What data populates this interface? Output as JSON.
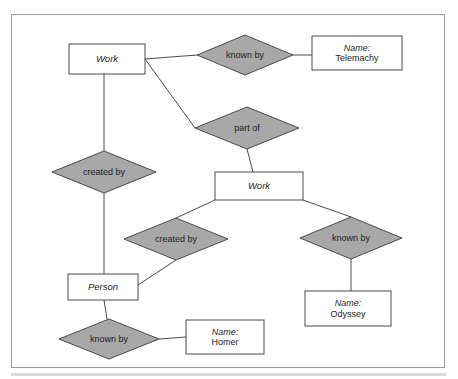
{
  "diagram": {
    "type": "entity-relationship-diagram",
    "title": "",
    "colors": {
      "relationship_fill": "#a8a8a8",
      "entity_fill": "#ffffff",
      "stroke": "#4a4a4a",
      "frame_border": "#9a9a9a",
      "background": "#ffffff",
      "text": "#1c1c1c"
    },
    "nodes": [
      {
        "id": "work-top",
        "kind": "entity",
        "shape": "rectangle",
        "label": "Work",
        "x": 69,
        "y": 44,
        "width": 76,
        "height": 30
      },
      {
        "id": "known-by-top",
        "kind": "relationship",
        "shape": "diamond",
        "label": "known by",
        "cx": 245,
        "cy": 55,
        "rx": 48,
        "ry": 20
      },
      {
        "id": "name-telemachy",
        "kind": "attribute",
        "shape": "rectangle",
        "key": "Name:",
        "value": "Telemachy",
        "x": 312,
        "y": 36,
        "width": 90,
        "height": 34
      },
      {
        "id": "part-of",
        "kind": "relationship",
        "shape": "diamond",
        "label": "part of",
        "cx": 247,
        "cy": 128,
        "rx": 52,
        "ry": 21
      },
      {
        "id": "created-by-left",
        "kind": "relationship",
        "shape": "diamond",
        "label": "created by",
        "cx": 104,
        "cy": 172,
        "rx": 52,
        "ry": 21
      },
      {
        "id": "work-middle",
        "kind": "entity",
        "shape": "rectangle",
        "label": "Work",
        "x": 215,
        "y": 172,
        "width": 88,
        "height": 28
      },
      {
        "id": "created-by-middle",
        "kind": "relationship",
        "shape": "diamond",
        "label": "created by",
        "cx": 176,
        "cy": 239,
        "rx": 52,
        "ry": 21
      },
      {
        "id": "known-by-right",
        "kind": "relationship",
        "shape": "diamond",
        "label": "known by",
        "cx": 351,
        "cy": 238,
        "rx": 51,
        "ry": 21
      },
      {
        "id": "person",
        "kind": "entity",
        "shape": "rectangle",
        "label": "Person",
        "x": 68,
        "y": 274,
        "width": 70,
        "height": 26
      },
      {
        "id": "name-odyssey",
        "kind": "attribute",
        "shape": "rectangle",
        "key": "Name:",
        "value": "Odyssey",
        "x": 305,
        "y": 291,
        "width": 86,
        "height": 35
      },
      {
        "id": "known-by-bottom",
        "kind": "relationship",
        "shape": "diamond",
        "label": "known by",
        "cx": 109,
        "cy": 339,
        "rx": 50,
        "ry": 20
      },
      {
        "id": "name-homer",
        "kind": "attribute",
        "shape": "rectangle",
        "key": "Name:",
        "value": "Homer",
        "x": 186,
        "y": 320,
        "width": 78,
        "height": 34
      }
    ],
    "edges": [
      {
        "id": "e1",
        "from": "work-top",
        "to": "known-by-top",
        "x1": 145,
        "y1": 59,
        "x2": 197,
        "y2": 55
      },
      {
        "id": "e2",
        "from": "known-by-top",
        "to": "name-telemachy",
        "x1": 293,
        "y1": 55,
        "x2": 312,
        "y2": 55
      },
      {
        "id": "e3",
        "from": "work-top",
        "to": "part-of",
        "x1": 145,
        "y1": 59,
        "x2": 195,
        "y2": 128
      },
      {
        "id": "e4",
        "from": "work-top",
        "to": "created-by-left",
        "x1": 104,
        "y1": 74,
        "x2": 104,
        "y2": 151
      },
      {
        "id": "e5",
        "from": "created-by-left",
        "to": "person",
        "x1": 104,
        "y1": 193,
        "x2": 104,
        "y2": 274
      },
      {
        "id": "e6",
        "from": "part-of",
        "to": "work-middle",
        "x1": 247,
        "y1": 149,
        "x2": 253,
        "y2": 172
      },
      {
        "id": "e7",
        "from": "work-middle",
        "to": "created-by-middle",
        "x1": 215,
        "y1": 200,
        "x2": 176,
        "y2": 218
      },
      {
        "id": "e8",
        "from": "work-middle",
        "to": "known-by-right",
        "x1": 303,
        "y1": 200,
        "x2": 351,
        "y2": 217
      },
      {
        "id": "e9",
        "from": "created-by-middle",
        "to": "person",
        "x1": 176,
        "y1": 260,
        "x2": 138,
        "y2": 285
      },
      {
        "id": "e10",
        "from": "known-by-right",
        "to": "name-odyssey",
        "x1": 351,
        "y1": 259,
        "x2": 351,
        "y2": 291
      },
      {
        "id": "e11",
        "from": "person",
        "to": "known-by-bottom",
        "x1": 104,
        "y1": 300,
        "x2": 107,
        "y2": 319
      },
      {
        "id": "e12",
        "from": "known-by-bottom",
        "to": "name-homer",
        "x1": 159,
        "y1": 339,
        "x2": 186,
        "y2": 337
      }
    ]
  }
}
